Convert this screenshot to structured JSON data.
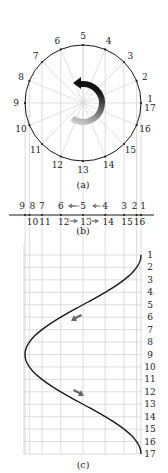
{
  "figure": {
    "panels": {
      "a": {
        "caption": "(a)"
      },
      "b": {
        "caption": "(b)"
      },
      "c": {
        "caption": "(c)"
      }
    },
    "circle_points": {
      "count": 16,
      "labels": [
        "1",
        "2",
        "3",
        "4",
        "5",
        "6",
        "7",
        "8",
        "9",
        "10",
        "11",
        "12",
        "13",
        "14",
        "15",
        "16"
      ],
      "closing_label": "17",
      "start_angle_deg": 0,
      "step_deg": 22.5,
      "rotation": "counter-clockwise"
    },
    "line_labels": {
      "upper": [
        "9",
        "8",
        "7",
        "6",
        "5",
        "4",
        "3",
        "2",
        "1"
      ],
      "lower": [
        "10",
        "11",
        "12",
        "13",
        "14",
        "15",
        "16"
      ],
      "upper_arrows": [
        {
          "from": "4",
          "to": "5"
        },
        {
          "from": "5",
          "to": "6"
        }
      ],
      "lower_arrows": [
        {
          "from": "12",
          "to": "13"
        },
        {
          "from": "13",
          "to": "14"
        }
      ]
    },
    "graph": {
      "row_labels": [
        "1",
        "2",
        "3",
        "4",
        "5",
        "6",
        "7",
        "8",
        "9",
        "10",
        "11",
        "12",
        "13",
        "14",
        "15",
        "16",
        "17"
      ],
      "curve": "cosine",
      "arrows": [
        {
          "near_row": 6,
          "direction": "down-left"
        },
        {
          "near_row": 12,
          "direction": "down-right"
        }
      ]
    },
    "colors": {
      "ink": "#1a1a1a",
      "grid": "#d4d4d4",
      "arrow_light": "#d0d0d0",
      "arrow_dark": "#111111"
    }
  }
}
